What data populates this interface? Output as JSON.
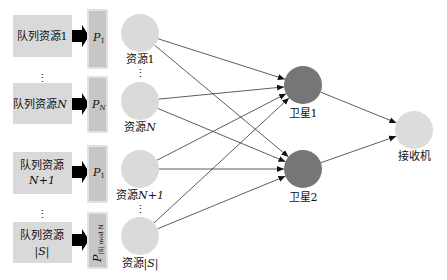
{
  "queues": [
    {
      "id": "q1",
      "line1": "队列资源1",
      "line2": "",
      "p_label": "P",
      "p_sub": "1",
      "p_rotated": false
    },
    {
      "id": "qN",
      "line1": "队列资源",
      "line1_var": "N",
      "line2": "",
      "p_label": "P",
      "p_sub": "N",
      "p_rotated": false
    },
    {
      "id": "qN1",
      "line1": "队列资源",
      "line2": "N+1",
      "p_label": "P",
      "p_sub": "1",
      "p_rotated": false
    },
    {
      "id": "qS",
      "line1": "队列资源",
      "line2": "|S|",
      "p_label": "P",
      "p_sub": "|S| mod N",
      "p_rotated": true
    }
  ],
  "resources": [
    {
      "id": "r1",
      "label": "资源",
      "var": "1",
      "italic": false
    },
    {
      "id": "rN",
      "label": "资源",
      "var": "N",
      "italic": true
    },
    {
      "id": "rN1",
      "label": "资源",
      "var": "N+1",
      "italic": true
    },
    {
      "id": "rS",
      "label": "资源",
      "var": "|S|",
      "italic": true
    }
  ],
  "satellites": [
    {
      "id": "s1",
      "label": "卫星1"
    },
    {
      "id": "s2",
      "label": "卫星2"
    }
  ],
  "receiver": {
    "id": "rx",
    "label": "接收机"
  },
  "ellipsis": "⋮",
  "edges": [
    [
      "r1",
      "s1"
    ],
    [
      "r1",
      "s2"
    ],
    [
      "rN",
      "s1"
    ],
    [
      "rN",
      "s2"
    ],
    [
      "rN1",
      "s1"
    ],
    [
      "rN1",
      "s2"
    ],
    [
      "rS",
      "s1"
    ],
    [
      "rS",
      "s2"
    ],
    [
      "s1",
      "rx"
    ],
    [
      "s2",
      "rx"
    ]
  ],
  "colors": {
    "queue_fill": "#d9d9d9",
    "p_fill": "#c6c6c6",
    "p_border": "#e2e2e2",
    "resource_fill": "#dadada",
    "satellite_fill": "#767676",
    "receiver_fill": "#dcdcdc",
    "arrow": "#000000",
    "edge": "#333333"
  }
}
